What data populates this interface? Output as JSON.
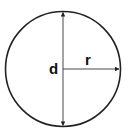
{
  "diagram": {
    "labels": {
      "diameter": "d",
      "radius": "r"
    },
    "colors": {
      "stroke": "#222222",
      "background": "#ffffff"
    },
    "shapes": {
      "circle": {
        "cx": 63,
        "cy": 69,
        "r": 57.5
      },
      "diameter_line": {
        "x": 63,
        "y1": 11.5,
        "y2": 126.5
      },
      "radius_line": {
        "x1": 63,
        "x2": 120,
        "y": 69
      }
    }
  }
}
